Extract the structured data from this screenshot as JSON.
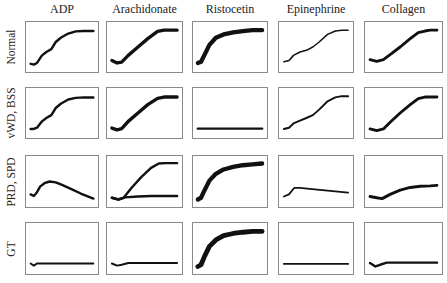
{
  "figure": {
    "columns": [
      "ADP",
      "Arachidonate",
      "Ristocetin",
      "Epinephrine",
      "Collagen"
    ],
    "rows": [
      "Normal",
      "vWD, BSS",
      "PRD, SPD",
      "GT"
    ]
  },
  "chart_data": {
    "type": "line",
    "title": "",
    "layout": "small multiples grid, 4 rows x 5 columns, no axes/ticks, no legend",
    "xlabel": "time",
    "ylabel": "platelet aggregation (light transmission)",
    "column_labels": [
      "ADP",
      "Arachidonate",
      "Ristocetin",
      "Epinephrine",
      "Collagen"
    ],
    "row_labels": [
      "Normal",
      "vWD, BSS",
      "PRD, SPD",
      "GT"
    ],
    "note": "Values are normalized 0-1 (0 = baseline, 1 = maximal aggregation), read from curve shapes.",
    "panels": [
      {
        "row": "Normal",
        "col": "ADP",
        "shape": "biphasic rise to plateau",
        "x": [
          0,
          0.05,
          0.1,
          0.18,
          0.25,
          0.33,
          0.4,
          0.48,
          0.6,
          0.72,
          0.85,
          1
        ],
        "y": [
          0.1,
          0.08,
          0.12,
          0.3,
          0.38,
          0.45,
          0.62,
          0.72,
          0.82,
          0.87,
          0.88,
          0.88
        ],
        "width": 2.5
      },
      {
        "row": "Normal",
        "col": "Arachidonate",
        "shape": "sigmoid rise to plateau",
        "x": [
          0,
          0.08,
          0.15,
          0.25,
          0.4,
          0.55,
          0.7,
          0.8,
          0.9,
          1
        ],
        "y": [
          0.18,
          0.12,
          0.14,
          0.3,
          0.5,
          0.7,
          0.87,
          0.9,
          0.9,
          0.9
        ],
        "width": 3.5
      },
      {
        "row": "Normal",
        "col": "Ristocetin",
        "shape": "rapid rise to plateau",
        "x": [
          0,
          0.05,
          0.1,
          0.18,
          0.28,
          0.4,
          0.55,
          0.7,
          0.85,
          1
        ],
        "y": [
          0.12,
          0.15,
          0.3,
          0.55,
          0.72,
          0.8,
          0.85,
          0.88,
          0.9,
          0.9
        ],
        "width": 4.5
      },
      {
        "row": "Normal",
        "col": "Epinephrine",
        "shape": "biphasic rise to plateau",
        "x": [
          0,
          0.08,
          0.15,
          0.25,
          0.35,
          0.45,
          0.55,
          0.68,
          0.8,
          0.9,
          1
        ],
        "y": [
          0.15,
          0.18,
          0.3,
          0.38,
          0.42,
          0.5,
          0.62,
          0.8,
          0.88,
          0.9,
          0.9
        ],
        "width": 1.6
      },
      {
        "row": "Normal",
        "col": "Collagen",
        "shape": "lag, dip, then rise to plateau",
        "x": [
          0,
          0.1,
          0.2,
          0.3,
          0.45,
          0.6,
          0.72,
          0.82,
          0.9,
          1
        ],
        "y": [
          0.2,
          0.16,
          0.2,
          0.32,
          0.5,
          0.7,
          0.84,
          0.88,
          0.9,
          0.9
        ],
        "width": 3
      },
      {
        "row": "vWD, BSS",
        "col": "ADP",
        "shape": "biphasic rise to plateau",
        "x": [
          0,
          0.05,
          0.1,
          0.18,
          0.25,
          0.33,
          0.4,
          0.48,
          0.6,
          0.72,
          0.85,
          1
        ],
        "y": [
          0.12,
          0.12,
          0.15,
          0.3,
          0.38,
          0.45,
          0.62,
          0.72,
          0.82,
          0.86,
          0.87,
          0.87
        ],
        "width": 2.5
      },
      {
        "row": "vWD, BSS",
        "col": "Arachidonate",
        "shape": "sigmoid rise to plateau",
        "x": [
          0,
          0.08,
          0.15,
          0.25,
          0.4,
          0.55,
          0.7,
          0.8,
          0.9,
          1
        ],
        "y": [
          0.14,
          0.1,
          0.13,
          0.3,
          0.5,
          0.7,
          0.85,
          0.88,
          0.88,
          0.88
        ],
        "width": 3.5
      },
      {
        "row": "vWD, BSS",
        "col": "Ristocetin",
        "shape": "flat (no aggregation)",
        "x": [
          0,
          0.25,
          0.5,
          0.75,
          1
        ],
        "y": [
          0.13,
          0.13,
          0.13,
          0.13,
          0.13
        ],
        "width": 2.5
      },
      {
        "row": "vWD, BSS",
        "col": "Epinephrine",
        "shape": "biphasic rise to plateau",
        "x": [
          0,
          0.08,
          0.15,
          0.25,
          0.35,
          0.45,
          0.55,
          0.68,
          0.8,
          0.9,
          1
        ],
        "y": [
          0.12,
          0.15,
          0.25,
          0.32,
          0.38,
          0.45,
          0.58,
          0.78,
          0.87,
          0.9,
          0.9
        ],
        "width": 2
      },
      {
        "row": "vWD, BSS",
        "col": "Collagen",
        "shape": "lag, dip, then rise to plateau",
        "x": [
          0,
          0.1,
          0.2,
          0.3,
          0.45,
          0.6,
          0.72,
          0.82,
          0.9,
          1
        ],
        "y": [
          0.12,
          0.08,
          0.12,
          0.28,
          0.5,
          0.7,
          0.84,
          0.88,
          0.88,
          0.88
        ],
        "width": 3
      },
      {
        "row": "PRD, SPD",
        "col": "ADP",
        "shape": "primary wave then disaggregation",
        "x": [
          0,
          0.05,
          0.1,
          0.15,
          0.22,
          0.3,
          0.4,
          0.5,
          0.65,
          0.8,
          1
        ],
        "y": [
          0.2,
          0.16,
          0.25,
          0.38,
          0.46,
          0.5,
          0.48,
          0.42,
          0.32,
          0.22,
          0.1
        ],
        "width": 2.5
      },
      {
        "row": "PRD, SPD",
        "col": "Arachidonate",
        "shape": "two traces: one full aggregation, one low flat response",
        "series": [
          {
            "name": "trace 1 (full)",
            "x": [
              0,
              0.1,
              0.18,
              0.3,
              0.45,
              0.6,
              0.72,
              0.82,
              0.9,
              1
            ],
            "y": [
              0.12,
              0.08,
              0.12,
              0.35,
              0.6,
              0.82,
              0.92,
              0.93,
              0.93,
              0.93
            ]
          },
          {
            "name": "trace 2 (flat)",
            "x": [
              0,
              0.1,
              0.2,
              0.4,
              0.6,
              0.8,
              1
            ],
            "y": [
              0.12,
              0.08,
              0.13,
              0.15,
              0.16,
              0.16,
              0.16
            ]
          }
        ],
        "width": 2.5
      },
      {
        "row": "PRD, SPD",
        "col": "Ristocetin",
        "shape": "rapid rise to plateau",
        "x": [
          0,
          0.05,
          0.1,
          0.18,
          0.28,
          0.4,
          0.55,
          0.7,
          0.85,
          1
        ],
        "y": [
          0.08,
          0.12,
          0.28,
          0.52,
          0.68,
          0.78,
          0.84,
          0.88,
          0.9,
          0.92
        ],
        "width": 4.5
      },
      {
        "row": "PRD, SPD",
        "col": "Epinephrine",
        "shape": "small primary wave, slow decline",
        "x": [
          0,
          0.08,
          0.16,
          0.25,
          0.4,
          0.6,
          0.8,
          1
        ],
        "y": [
          0.15,
          0.2,
          0.35,
          0.35,
          0.33,
          0.3,
          0.27,
          0.24
        ],
        "width": 1.8
      },
      {
        "row": "PRD, SPD",
        "col": "Collagen",
        "shape": "dip then reduced rise",
        "x": [
          0,
          0.1,
          0.18,
          0.3,
          0.45,
          0.6,
          0.75,
          0.9,
          1
        ],
        "y": [
          0.15,
          0.12,
          0.1,
          0.2,
          0.3,
          0.36,
          0.39,
          0.4,
          0.41
        ],
        "width": 3
      },
      {
        "row": "GT",
        "col": "ADP",
        "shape": "flat (no aggregation)",
        "x": [
          0,
          0.05,
          0.1,
          0.3,
          0.6,
          1
        ],
        "y": [
          0.15,
          0.1,
          0.15,
          0.15,
          0.15,
          0.15
        ],
        "width": 2
      },
      {
        "row": "GT",
        "col": "Arachidonate",
        "shape": "flat (no aggregation)",
        "x": [
          0,
          0.08,
          0.15,
          0.25,
          0.5,
          1
        ],
        "y": [
          0.15,
          0.1,
          0.12,
          0.16,
          0.16,
          0.16
        ],
        "width": 2
      },
      {
        "row": "GT",
        "col": "Ristocetin",
        "shape": "rapid rise to plateau (normal)",
        "x": [
          0,
          0.05,
          0.1,
          0.18,
          0.28,
          0.4,
          0.55,
          0.7,
          0.85,
          1
        ],
        "y": [
          0.08,
          0.12,
          0.3,
          0.55,
          0.7,
          0.8,
          0.85,
          0.88,
          0.9,
          0.9
        ],
        "width": 5
      },
      {
        "row": "GT",
        "col": "Epinephrine",
        "shape": "flat (no aggregation)",
        "x": [
          0,
          0.25,
          0.5,
          0.75,
          1
        ],
        "y": [
          0.14,
          0.14,
          0.14,
          0.14,
          0.14
        ],
        "width": 1.8
      },
      {
        "row": "GT",
        "col": "Collagen",
        "shape": "dip then flat",
        "x": [
          0,
          0.08,
          0.15,
          0.25,
          0.5,
          1
        ],
        "y": [
          0.16,
          0.08,
          0.12,
          0.17,
          0.17,
          0.17
        ],
        "width": 2.5
      }
    ],
    "colors": {
      "trace": "#111111",
      "panel_border": "#8a8a8a",
      "background": "#ffffff"
    }
  }
}
